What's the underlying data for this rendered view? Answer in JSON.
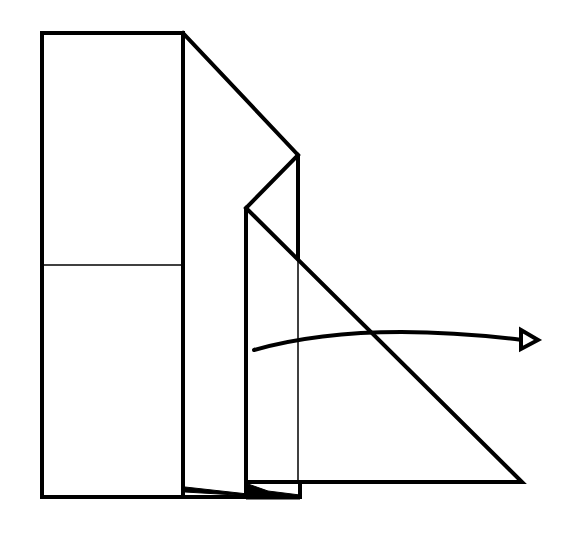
{
  "diagram": {
    "type": "origami-fold-step",
    "colors": {
      "line": "#000000",
      "background": "#ffffff"
    },
    "elements": {
      "left_panel": {
        "x": 42,
        "y": 32,
        "width": 141,
        "height": 465
      },
      "crease_line_y": 265,
      "arrow": {
        "direction": "right",
        "style": "valley-fold-arrow",
        "head": "hollow-triangle"
      }
    }
  }
}
